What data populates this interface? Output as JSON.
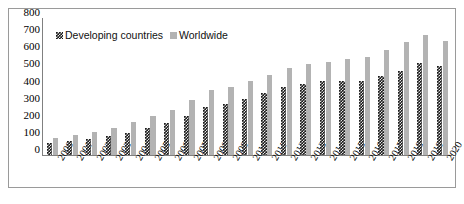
{
  "chart_data": {
    "type": "bar",
    "title": "",
    "xlabel": "",
    "ylabel": "",
    "ylim": [
      0,
      800
    ],
    "ytick_step": 100,
    "grid": false,
    "legend_position": "top-left-inside",
    "categories": [
      "2000",
      "2001",
      "2002",
      "2003",
      "2004",
      "2005",
      "2006",
      "2007",
      "2008",
      "2009",
      "2010",
      "2011",
      "2012",
      "2013",
      "2014",
      "2015",
      "2016",
      "2017",
      "2018",
      "2019",
      "2020"
    ],
    "yticks": [
      "800",
      "700",
      "600",
      "500",
      "400",
      "300",
      "200",
      "100",
      "0"
    ],
    "series": [
      {
        "name": "Developing countries",
        "color": "#1a1a1a",
        "pattern": "checkered",
        "values": [
          70,
          80,
          95,
          110,
          130,
          160,
          185,
          230,
          280,
          300,
          330,
          360,
          395,
          415,
          430,
          430,
          430,
          460,
          490,
          540,
          520
        ]
      },
      {
        "name": "Worldwide",
        "color": "#b3b3b3",
        "pattern": "solid",
        "values": [
          100,
          115,
          135,
          160,
          190,
          230,
          265,
          320,
          380,
          400,
          430,
          470,
          510,
          530,
          545,
          560,
          575,
          615,
          660,
          700,
          665
        ]
      }
    ]
  },
  "legend": {
    "entries": [
      {
        "label": "Developing countries"
      },
      {
        "label": "Worldwide"
      }
    ]
  }
}
